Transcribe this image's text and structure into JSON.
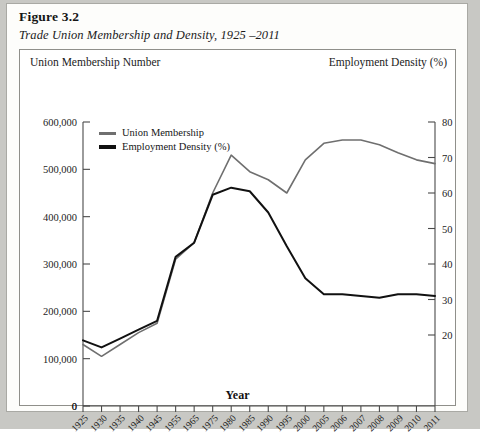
{
  "figure": {
    "number_label": "Figure 3.2",
    "caption": "Trade Union Membership and Density, 1925 –2011"
  },
  "axes": {
    "left_axis_title": "Union Membership Number",
    "right_axis_title": "Employment Density (%)",
    "x_axis_title": "Year"
  },
  "legend": {
    "items": [
      {
        "label": "Union Membership",
        "color": "#6f6f6f"
      },
      {
        "label": "Employment Density (%)",
        "color": "#111111"
      }
    ]
  },
  "chart_data": {
    "type": "line",
    "title": "Trade Union Membership and Density, 1925 –2011",
    "xlabel": "Year",
    "ylabel": "Union Membership Number",
    "y2label": "Employment Density (%)",
    "grid": false,
    "legend_position": "top-left",
    "categories": [
      "1925",
      "1930",
      "1935",
      "1940",
      "1945",
      "1955",
      "1965",
      "1975",
      "1980",
      "1985",
      "1990",
      "1995",
      "2000",
      "2005",
      "2006",
      "2007",
      "2008",
      "2009",
      "2010",
      "2011"
    ],
    "ylim": [
      0,
      600000
    ],
    "yticks": [
      0,
      100000,
      200000,
      300000,
      400000,
      500000,
      600000
    ],
    "ytick_labels": [
      "0",
      "100,000",
      "200,000",
      "300,000",
      "400,000",
      "500,000",
      "600,000"
    ],
    "y2lim": [
      0,
      80
    ],
    "y2ticks": [
      20,
      30,
      40,
      50,
      60,
      70,
      80
    ],
    "y2tick_labels": [
      "20",
      "30",
      "40",
      "50",
      "60",
      "70",
      "80"
    ],
    "series": [
      {
        "name": "Union Membership",
        "axis": "left",
        "color": "#6f6f6f",
        "values": [
          130000,
          105000,
          130000,
          155000,
          175000,
          310000,
          345000,
          450000,
          530000,
          495000,
          478000,
          450000,
          520000,
          555000,
          562000,
          562000,
          552000,
          535000,
          520000,
          512000
        ]
      },
      {
        "name": "Employment Density (%)",
        "axis": "right",
        "color": "#111111",
        "values": [
          18.5,
          16.5,
          19.0,
          21.5,
          24.0,
          42.0,
          46.0,
          59.5,
          61.5,
          60.5,
          54.5,
          45.0,
          36.0,
          31.5,
          31.5,
          31.0,
          30.5,
          31.5,
          31.5,
          31.0
        ]
      }
    ]
  }
}
